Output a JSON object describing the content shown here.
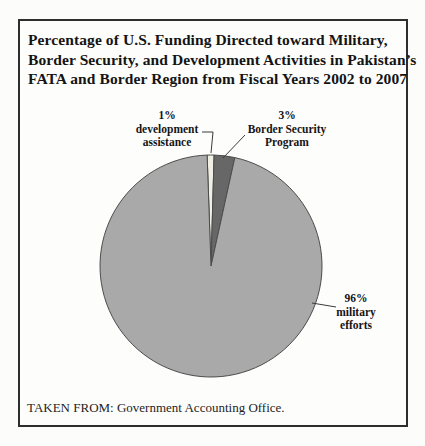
{
  "figure": {
    "border_color": "#2e2e2e",
    "title_lines": [
      "Percentage of U.S. Funding Directed toward Military,",
      "Border Security, and Development Activities in Pakistan’s",
      "FATA and Border Region from Fiscal Years 2002 to 2007"
    ],
    "source_note": "TAKEN FROM: Government Accounting Office."
  },
  "chart_data": {
    "type": "pie",
    "title": "Percentage of U.S. Funding Directed toward Military, Border Security, and Development Activities in Pakistan’s FATA and Border Region from Fiscal Years 2002 to 2007",
    "source": "TAKEN FROM: Government Accounting Office.",
    "legend_position": "callouts",
    "start_angle_deg_from_top": -2,
    "outline_color": "#4c4c4c",
    "leader_line_color": "#3a3a3a",
    "slices": [
      {
        "id": "development-assistance",
        "label": "development assistance",
        "value_pct": 1,
        "color": "#f0efe3",
        "callout": [
          "1%",
          "development",
          "assistance"
        ]
      },
      {
        "id": "border-security-program",
        "label": "Border Security Program",
        "value_pct": 3,
        "color": "#676767",
        "callout": [
          "3%",
          "Border Security",
          "Program"
        ]
      },
      {
        "id": "military-efforts",
        "label": "military efforts",
        "value_pct": 96,
        "color": "#a9a9a9",
        "callout": [
          "96%",
          "military",
          "efforts"
        ]
      }
    ]
  }
}
